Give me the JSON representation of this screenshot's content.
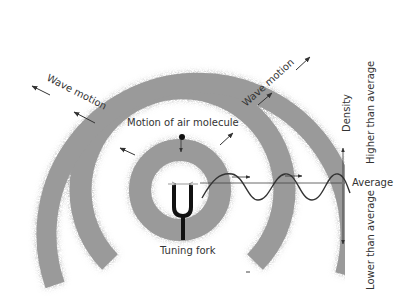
{
  "diagram": {
    "labels": {
      "wave_motion_left": "Wave motion",
      "wave_motion_right": "Wave motion",
      "motion_of_air_molecule": "Motion of air molecule",
      "tuning_fork": "Tuning fork",
      "density": "Density",
      "higher_than_average": "Higher than average",
      "average": "Average",
      "lower_than_average": "Lower than average"
    },
    "colors": {
      "ring": "#9a9a9a",
      "ink": "#333333",
      "fork": "#111111"
    },
    "elements": {
      "rings": [
        "inner compression ring",
        "middle compression ring",
        "outer compression ring"
      ],
      "fork_icon": "tuning-fork-icon",
      "wave": "sine wave of density vs distance"
    }
  }
}
